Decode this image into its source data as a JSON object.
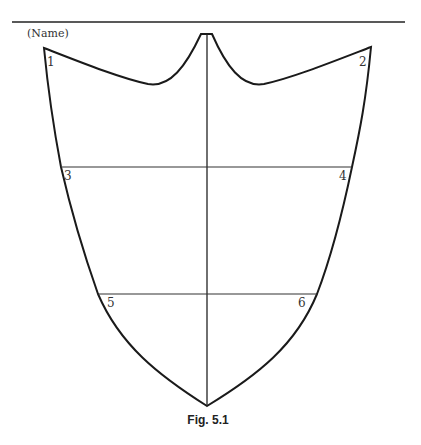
{
  "header": {
    "name_label": "(Name)"
  },
  "figure": {
    "caption": "Fig. 5.1",
    "point_labels": [
      "1",
      "2",
      "3",
      "4",
      "5",
      "6"
    ],
    "stroke_color": "#1a1a1a",
    "guide_color": "#333333"
  }
}
